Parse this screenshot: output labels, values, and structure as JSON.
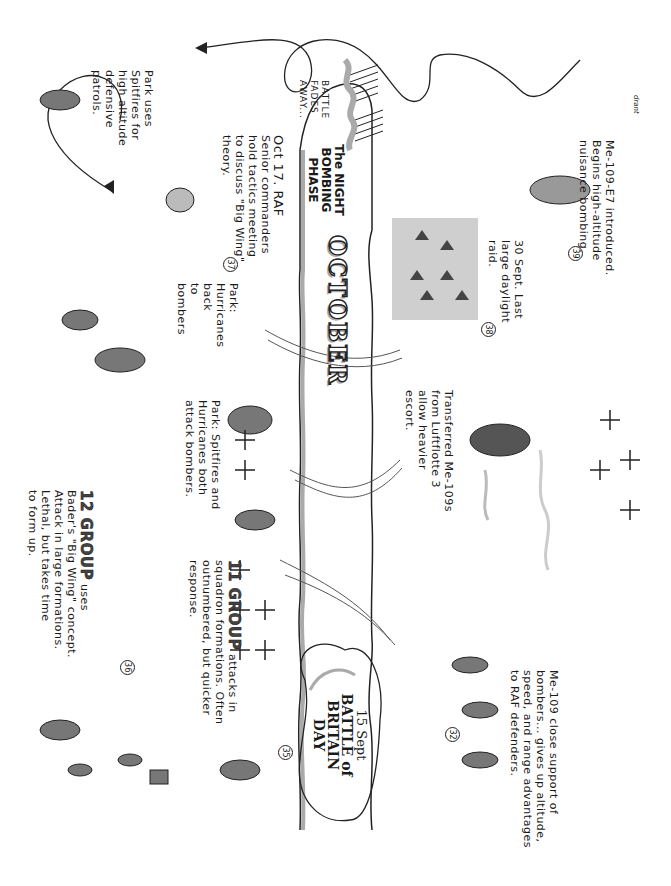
{
  "page": {
    "orientation": "rotated 90 degrees clockwise",
    "signature": "drant"
  },
  "timeline": {
    "month_label": "OCTOBER",
    "phase_label": "The NIGHT BOMBING PHASE",
    "battle_fades": "BATTLE FADES AWAY..."
  },
  "events": {
    "e12group": {
      "heading": "12 GROUP",
      "text_line1": "uses",
      "text_line2": "Bader's \"Big Wing\" concept.",
      "text_line3": "Attack in large formations.",
      "text_line4": "Lethal, but takes time",
      "text_line5": "to form up."
    },
    "e11group": {
      "heading": "11 GROUP",
      "text_line1": "attacks in",
      "text_line2": "squadron formations. Often",
      "text_line3": "outnumbered, but quicker",
      "text_line4": "response."
    },
    "battle_day": {
      "number": "35",
      "date": "15 Sept",
      "title_line1": "BATTLE of",
      "title_line2": "BRITAIN",
      "title_line3": "DAY"
    },
    "marker36": {
      "number": "36"
    },
    "marker32": {
      "number": "32"
    },
    "me109_support": {
      "line1": "Me-109 close support of",
      "line2": "bombers... gives up altitude,",
      "line3": "speed, and range advantages",
      "line4": "to RAF defenders."
    },
    "park_both": {
      "line1": "Park: Spitfires and",
      "line2": "Hurricanes both",
      "line3": "attack bombers."
    },
    "park_hurricanes": {
      "line1": "Park:",
      "line2": "Hurricanes",
      "line3": "back",
      "line4": "to",
      "line5": "bombers"
    },
    "transferred": {
      "line1": "Transferred Me-109s",
      "line2": "from Luftflotte 3",
      "line3": "allow heavier",
      "line4": "escort."
    },
    "oct17": {
      "number": "37",
      "line1": "Oct 17. RAF",
      "line2": "Senior commanders",
      "line3": "hold tactics meeting",
      "line4": "to discuss \"Big Wing\"",
      "line5": "theory."
    },
    "sept30": {
      "number": "38",
      "line1": "30 Sept. Last",
      "line2": "large daylight",
      "line3": "raid."
    },
    "park_spitfires": {
      "line1": "Park uses",
      "line2": "Spitfires for",
      "line3": "high altitude",
      "line4": "defensive",
      "line5": "patrols."
    },
    "me109e7": {
      "number": "39",
      "line1": "Me-109-E7 introduced.",
      "line2": "Begins high-altitude",
      "line3": "nuisance bombing."
    }
  },
  "colors": {
    "ink": "#1a1a1a",
    "shade": "#9a9a9a",
    "light_shade": "#cfcfcf",
    "paper": "#ffffff"
  }
}
